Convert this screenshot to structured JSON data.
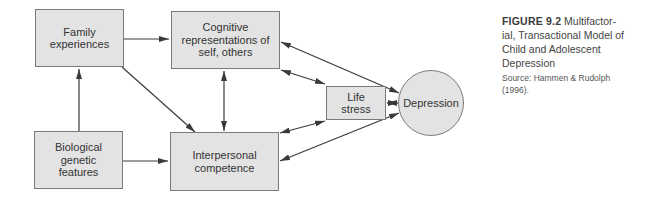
{
  "figure": {
    "number": "FIGURE 9.2",
    "title_display": "  Multifactor-\nial, Transactional Model of\nChild and Adolescent\nDepression",
    "source": "Source: Hammen & Rudolph\n(1996)."
  },
  "nodes": {
    "family": {
      "label": "Family\nexperiences"
    },
    "cognitive": {
      "label": "Cognitive\nrepresentations of\nself, others"
    },
    "biological": {
      "label": "Biological\ngenetic\nfeatures"
    },
    "interpersonal": {
      "label": "Interpersonal\ncompetence"
    },
    "life_stress": {
      "label": "Life\nstress"
    },
    "depression": {
      "label": "Depression"
    }
  },
  "edges": [
    {
      "from": "family",
      "to": "cognitive",
      "type": "directed"
    },
    {
      "from": "biological",
      "to": "family",
      "type": "directed"
    },
    {
      "from": "family",
      "to": "interpersonal",
      "type": "directed"
    },
    {
      "from": "biological",
      "to": "interpersonal",
      "type": "directed"
    },
    {
      "from": "cognitive",
      "to": "interpersonal",
      "type": "bidirectional"
    },
    {
      "from": "cognitive",
      "to": "life_stress",
      "type": "bidirectional"
    },
    {
      "from": "cognitive",
      "to": "depression",
      "type": "bidirectional"
    },
    {
      "from": "interpersonal",
      "to": "life_stress",
      "type": "bidirectional"
    },
    {
      "from": "interpersonal",
      "to": "depression",
      "type": "bidirectional"
    },
    {
      "from": "life_stress",
      "to": "depression",
      "type": "bidirectional"
    }
  ],
  "colors": {
    "box_fill": "#e3e3e3",
    "box_border": "#7a7a7a",
    "arrow": "#3a3a3a"
  }
}
